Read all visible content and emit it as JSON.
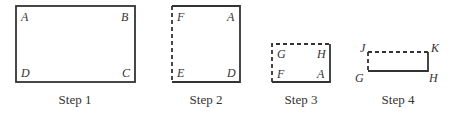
{
  "steps": [
    {
      "caption": "Step 1",
      "labels": {
        "tl": "A",
        "tr": "B",
        "bl": "D",
        "br": "C"
      }
    },
    {
      "caption": "Step 2",
      "labels": {
        "tl": "F",
        "tr": "A",
        "bl": "E",
        "br": "D"
      }
    },
    {
      "caption": "Step 3",
      "labels": {
        "tl": "G",
        "tr": "H",
        "bl": "F",
        "br": "A"
      }
    },
    {
      "caption": "Step 4",
      "labels": {
        "tl": "J",
        "tr": "K",
        "bl": "G",
        "br": "H"
      }
    }
  ]
}
